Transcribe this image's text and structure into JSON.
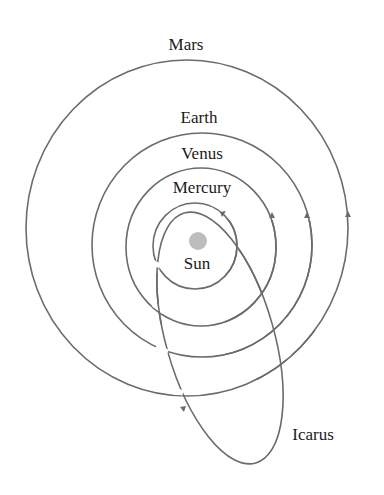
{
  "diagram": {
    "colors": {
      "orbit": "#6b6b6b",
      "sun": "#bdbdbd",
      "text": "#1a1a1a",
      "background": "#ffffff"
    },
    "labels": {
      "mars": "Mars",
      "earth": "Earth",
      "venus": "Venus",
      "mercury": "Mercury",
      "sun": "Sun",
      "icarus": "Icarus"
    }
  }
}
